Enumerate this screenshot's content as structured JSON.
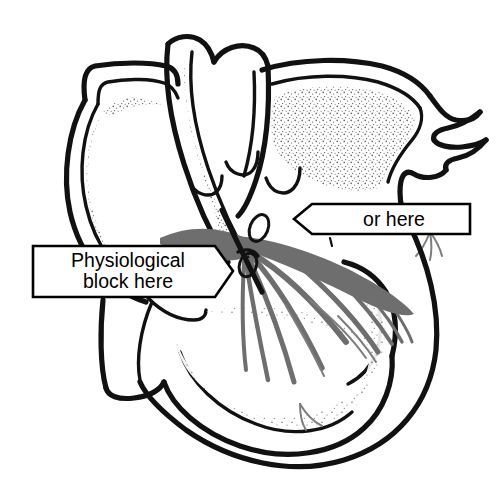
{
  "figure": {
    "background_color": "#ffffff",
    "width": 504,
    "height": 503
  },
  "callouts": [
    {
      "id": "physiological-block",
      "line1": "Physiological",
      "line2": "block here",
      "arrow_direction": "right",
      "box_fill": "#ffffff",
      "border_color": "#000000",
      "text_color": "#000000"
    },
    {
      "id": "or-here",
      "line1": "or here",
      "line2": "",
      "arrow_direction": "left",
      "box_fill": "#ffffff",
      "border_color": "#000000",
      "text_color": "#000000"
    }
  ],
  "anatomy": {
    "outline_color": "#111111",
    "conduction_color": "#6e6e6e",
    "stipple_color": "#5a5a5a",
    "structures": [
      "left-atrium",
      "right-atrium",
      "interventricular-septum",
      "left-ventricle",
      "right-ventricle",
      "aortic-arch",
      "atrioventricular-node",
      "bundle-of-his",
      "bundle-branches",
      "purkinje-fibers",
      "valve-leaflets"
    ]
  }
}
